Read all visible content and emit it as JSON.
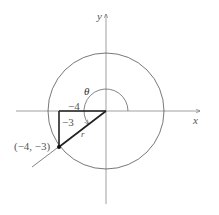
{
  "figure": {
    "axes": {
      "x_label": "x",
      "y_label": "y"
    },
    "angle_label": "θ",
    "point_label": "(−4, −3)",
    "horizontal_leg_label": "−4",
    "vertical_leg_label": "−3",
    "hypotenuse_label": "r",
    "point": {
      "x": -4,
      "y": -3
    },
    "colors": {
      "line": "#555555",
      "triangle": "#222222",
      "background": "#ffffff"
    }
  }
}
